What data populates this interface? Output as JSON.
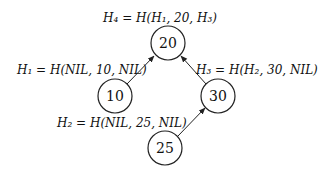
{
  "diagram": {
    "type": "hash-tree",
    "nodes": [
      {
        "id": "n20",
        "value": "20",
        "label": "H₄ = H(H₁, 20, H₃)",
        "cx": 168,
        "cy": 43
      },
      {
        "id": "n10",
        "value": "10",
        "label": "H₁ = H(NIL, 10, NIL)",
        "cx": 115,
        "cy": 96
      },
      {
        "id": "n30",
        "value": "30",
        "label": "H₃ = H(H₂, 30, NIL)",
        "cx": 218,
        "cy": 96
      },
      {
        "id": "n25",
        "value": "25",
        "label": "H₂ = H(NIL, 25, NIL)",
        "cx": 165,
        "cy": 148
      }
    ],
    "edges": [
      {
        "from": "n10",
        "to": "n20"
      },
      {
        "from": "n30",
        "to": "n20"
      },
      {
        "from": "n25",
        "to": "n30"
      }
    ]
  }
}
